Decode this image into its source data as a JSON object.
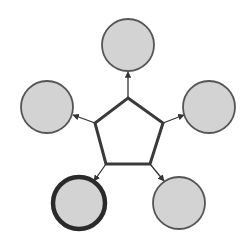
{
  "diagram": {
    "type": "hub-and-spoke",
    "colors": {
      "background": "#ffffff",
      "node_fill": "#d3d3d3",
      "node_stroke": "#555555",
      "highlight_stroke": "#2a2a2a",
      "hub_fill": "#ffffff",
      "hub_stroke": "#3a3a3a",
      "arrow": "#333333"
    },
    "hub": {
      "shape": "pentagon",
      "points": [
        [
          128,
          98
        ],
        [
          163,
          123
        ],
        [
          150,
          164
        ],
        [
          106,
          164
        ],
        [
          95,
          123
        ]
      ],
      "label": ""
    },
    "nodes": [
      {
        "id": "top",
        "cx": 128,
        "cy": 45,
        "r": 26,
        "highlighted": false,
        "label": ""
      },
      {
        "id": "right",
        "cx": 209,
        "cy": 107,
        "r": 26,
        "highlighted": false,
        "label": ""
      },
      {
        "id": "bottom-right",
        "cx": 179,
        "cy": 203,
        "r": 26,
        "highlighted": false,
        "label": ""
      },
      {
        "id": "bottom-left",
        "cx": 79,
        "cy": 203,
        "r": 26,
        "highlighted": true,
        "label": ""
      },
      {
        "id": "left",
        "cx": 47,
        "cy": 107,
        "r": 26,
        "highlighted": false,
        "label": ""
      }
    ],
    "edges": [
      {
        "from": [
          128,
          98
        ],
        "to": [
          128,
          72
        ],
        "direction": "outward"
      },
      {
        "from": [
          163,
          123
        ],
        "to": [
          184,
          115
        ],
        "direction": "outward"
      },
      {
        "from": [
          150,
          164
        ],
        "to": [
          164,
          181
        ],
        "direction": "outward"
      },
      {
        "from": [
          106,
          164
        ],
        "to": [
          94,
          181
        ],
        "direction": "outward"
      },
      {
        "from": [
          95,
          123
        ],
        "to": [
          73,
          115
        ],
        "direction": "outward"
      }
    ]
  }
}
